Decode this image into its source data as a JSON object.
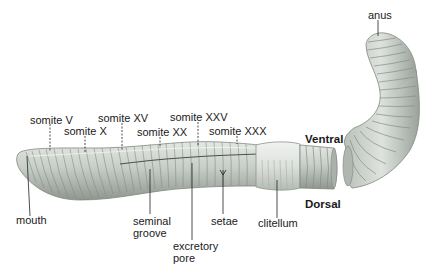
{
  "diagram": {
    "orientation": {
      "ventral": "Ventral",
      "dorsal": "Dorsal"
    },
    "labels": {
      "somite_v": "somite V",
      "somite_x": "somite X",
      "somite_xv": "somite XV",
      "somite_xx": "somite XX",
      "somite_xxv": "somite XXV",
      "somite_xxx": "somite XXX",
      "anus": "anus",
      "mouth": "mouth",
      "seminal_groove_1": "seminal",
      "seminal_groove_2": "groove",
      "setae": "setae",
      "clitellum": "clitellum",
      "excretory_pore_1": "excretory",
      "excretory_pore_2": "pore"
    },
    "colors": {
      "body": "#c9cfc9",
      "body_shadow": "#8e968f",
      "clitellum": "#dfe3df",
      "leader": "#222222"
    }
  }
}
